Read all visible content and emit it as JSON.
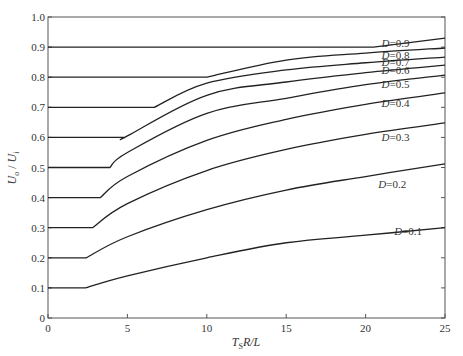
{
  "chart_data": {
    "type": "line",
    "title": "",
    "xlabel": "T_S R / L",
    "ylabel": "U_o / U_i",
    "xlim": [
      0,
      25
    ],
    "ylim": [
      0,
      1.0
    ],
    "xticks": [
      0,
      5,
      10,
      15,
      20,
      25
    ],
    "yticks": [
      0,
      0.1,
      0.2,
      0.3,
      0.4,
      0.5,
      0.6,
      0.7,
      0.8,
      0.9,
      1.0
    ],
    "ytick_labels": [
      "0",
      "0.1",
      "0.2",
      "0.3",
      "0.4",
      "0.5",
      "0.6",
      "0.7",
      "0.8",
      "0.9",
      "1.0"
    ],
    "xtick_labels": [
      "0",
      "5",
      "10",
      "15",
      "20",
      "25"
    ],
    "grid": false,
    "legend": "inline labels near right end of each curve",
    "series": [
      {
        "name": "D=0.1",
        "label": "D=0.1",
        "x": [
          0,
          2.35,
          5,
          10,
          15,
          20,
          25
        ],
        "values": [
          0.1,
          0.1,
          0.14,
          0.2,
          0.25,
          0.275,
          0.3
        ],
        "label_pos": [
          21.8,
          0.29
        ]
      },
      {
        "name": "D=0.2",
        "label": "D=0.2",
        "x": [
          0,
          2.4,
          5,
          10,
          15,
          20,
          25
        ],
        "values": [
          0.2,
          0.2,
          0.27,
          0.36,
          0.425,
          0.47,
          0.512
        ],
        "label_pos": [
          20.8,
          0.445
        ]
      },
      {
        "name": "D=0.3",
        "label": "D=0.3",
        "x": [
          0,
          2.8,
          5,
          10,
          15,
          20,
          25
        ],
        "values": [
          0.3,
          0.3,
          0.38,
          0.49,
          0.56,
          0.61,
          0.648
        ],
        "label_pos": [
          21.0,
          0.6
        ]
      },
      {
        "name": "D=0.4",
        "label": "D=0.4",
        "x": [
          0,
          3.3,
          5,
          10,
          15,
          20,
          25
        ],
        "values": [
          0.4,
          0.4,
          0.47,
          0.59,
          0.66,
          0.71,
          0.748
        ],
        "label_pos": [
          21.0,
          0.715
        ]
      },
      {
        "name": "D=0.5",
        "label": "D=0.5",
        "x": [
          0,
          3.9,
          5,
          10,
          15,
          20,
          25
        ],
        "values": [
          0.5,
          0.5,
          0.55,
          0.68,
          0.73,
          0.775,
          0.807
        ],
        "label_pos": [
          21.0,
          0.777
        ]
      },
      {
        "name": "D=0.6",
        "label": "D=0.6",
        "x": [
          0,
          4.85,
          5,
          10,
          15,
          20,
          25
        ],
        "values": [
          0.6,
          0.6,
          0.605,
          0.74,
          0.784,
          0.815,
          0.84
        ],
        "label_pos": [
          21.0,
          0.825
        ]
      },
      {
        "name": "D=0.7",
        "label": "D=0.7",
        "x": [
          0,
          6.7,
          10,
          15,
          20,
          25
        ],
        "values": [
          0.7,
          0.7,
          0.78,
          0.824,
          0.848,
          0.867
        ],
        "label_pos": [
          21.0,
          0.851
        ]
      },
      {
        "name": "D=0.8",
        "label": "D=0.8",
        "x": [
          0,
          10.0,
          15,
          20,
          25
        ],
        "values": [
          0.8,
          0.8,
          0.857,
          0.88,
          0.897
        ],
        "label_pos": [
          21.0,
          0.875
        ]
      },
      {
        "name": "D=0.9",
        "label": "D=0.9",
        "x": [
          0,
          20.5,
          25
        ],
        "values": [
          0.9,
          0.9,
          0.93
        ],
        "label_pos": [
          21.0,
          0.912
        ]
      }
    ]
  },
  "style": {
    "line_color": "#222222",
    "axis_color": "#555555",
    "text_color": "#333333",
    "background": "#ffffff"
  }
}
